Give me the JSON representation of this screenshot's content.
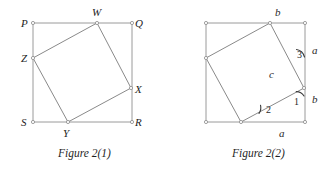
{
  "figures": [
    {
      "id": "figure-2-1",
      "caption": "Figure 2(1)",
      "outer_square": {
        "name": "PQRS",
        "vertices": [
          {
            "label": "P",
            "x": 33,
            "y": 23
          },
          {
            "label": "Q",
            "x": 132,
            "y": 23
          },
          {
            "label": "R",
            "x": 132,
            "y": 122
          },
          {
            "label": "S",
            "x": 33,
            "y": 122
          }
        ]
      },
      "inner_square": {
        "name": "WXYZ",
        "vertices": [
          {
            "label": "W",
            "x": 97,
            "y": 23
          },
          {
            "label": "X",
            "x": 131,
            "y": 88
          },
          {
            "label": "Y",
            "x": 68,
            "y": 122
          },
          {
            "label": "Z",
            "x": 33,
            "y": 58
          }
        ]
      }
    },
    {
      "id": "figure-2-2",
      "caption": "Figure 2(2)",
      "outer_square": {
        "vertices": [
          {
            "x": 206,
            "y": 23
          },
          {
            "x": 305,
            "y": 23
          },
          {
            "x": 305,
            "y": 122
          },
          {
            "x": 206,
            "y": 122
          }
        ]
      },
      "inner_square": {
        "vertices": [
          {
            "x": 270,
            "y": 23
          },
          {
            "x": 304,
            "y": 88
          },
          {
            "x": 241,
            "y": 122
          },
          {
            "x": 206,
            "y": 58
          }
        ]
      },
      "side_labels": [
        {
          "text": "b",
          "x": 275,
          "y": 7,
          "name": "side-label-b-top"
        },
        {
          "text": "a",
          "x": 312,
          "y": 45,
          "name": "side-label-a-right"
        },
        {
          "text": "b",
          "x": 312,
          "y": 94,
          "name": "side-label-b-right"
        },
        {
          "text": "a",
          "x": 279,
          "y": 128,
          "name": "side-label-a-bottom"
        },
        {
          "text": "c",
          "x": 269,
          "y": 69,
          "name": "side-label-c-hypotenuse"
        }
      ],
      "angle_labels": [
        {
          "text": "1",
          "x": 294,
          "y": 97,
          "name": "angle-label-1"
        },
        {
          "text": "2",
          "x": 266,
          "y": 105,
          "name": "angle-label-2"
        },
        {
          "text": "3",
          "x": 297,
          "y": 50,
          "name": "angle-label-3"
        }
      ]
    }
  ],
  "colors": {
    "outer_stroke": "#9a9a9a",
    "inner_stroke": "#8a8a8a",
    "vertex_fill": "#ffffff",
    "vertex_stroke": "#8a8a8a",
    "text": "#232323",
    "angle_arc": "#3a3a3a",
    "background": "#ffffff"
  },
  "vertex_label_positions": {
    "P": {
      "x": 21,
      "y": 18
    },
    "Q": {
      "x": 135,
      "y": 18
    },
    "R": {
      "x": 135,
      "y": 117
    },
    "S": {
      "x": 21,
      "y": 117
    },
    "W": {
      "x": 92,
      "y": 7
    },
    "X": {
      "x": 135,
      "y": 84
    },
    "Y": {
      "x": 63,
      "y": 128
    },
    "Z": {
      "x": 21,
      "y": 53
    }
  }
}
